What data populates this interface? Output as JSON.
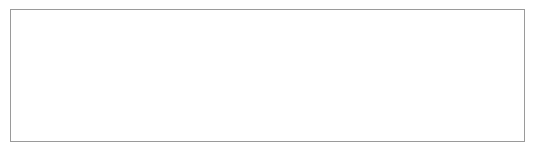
{
  "chart_data": {
    "type": "line",
    "title": "",
    "xlabel": "높이",
    "ylabel": "퍼텐셜 에너지",
    "ylabel_lines": [
      "퍼",
      "텐",
      "셜",
      "",
      "에",
      "너",
      "지"
    ],
    "annotation": "질량 : 일정",
    "origin_label": "0",
    "xlim": [
      0,
      1
    ],
    "ylim": [
      0,
      1
    ],
    "grid": false,
    "series": [
      {
        "name": "퍼텐셜 에너지",
        "x": [
          0,
          0.85
        ],
        "y": [
          0,
          1.0
        ]
      }
    ]
  }
}
